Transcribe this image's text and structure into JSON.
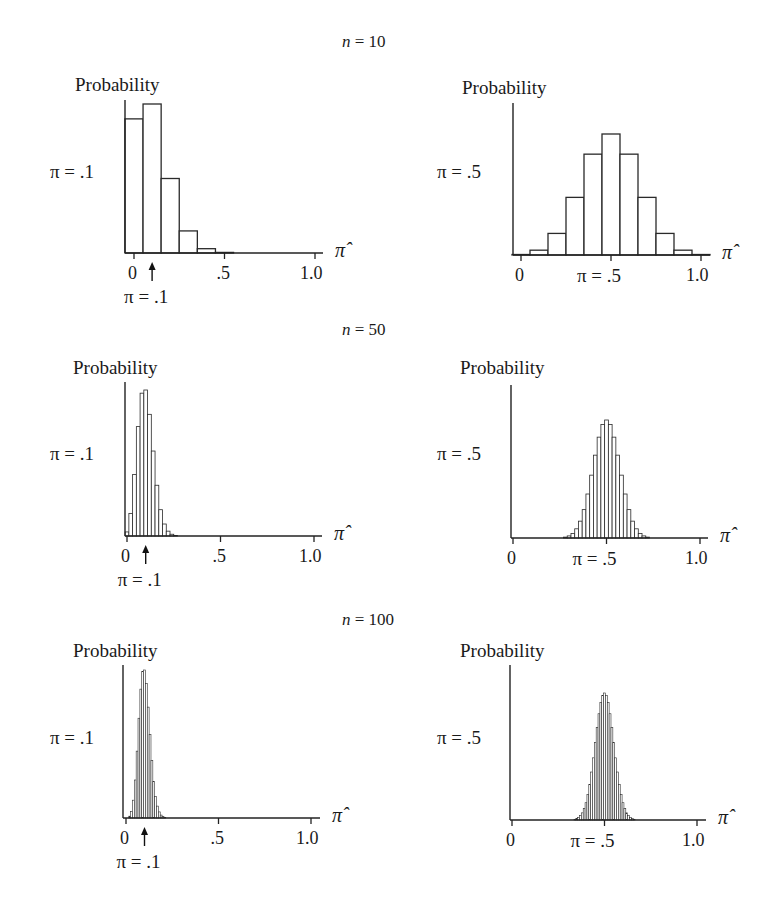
{
  "figure": {
    "rows": [
      {
        "n_label": "n = 10",
        "n_var": "n",
        "n_eq": " = 10"
      },
      {
        "n_label": "n = 50",
        "n_var": "n",
        "n_eq": " = 50"
      },
      {
        "n_label": "n = 100",
        "n_var": "n",
        "n_eq": " = 100"
      }
    ],
    "ylabel": "Probability",
    "xlabel": "π̂",
    "tick_labels": [
      "0",
      ".5",
      "1.0"
    ],
    "left_pi_label": "π = .1",
    "right_pi_label": "π = .5",
    "left_arrow_label": "π = .1",
    "right_center_label": "π = .5"
  },
  "chart_data": [
    {
      "type": "bar",
      "title": "n = 10, π = .1",
      "n": 10,
      "pi": 0.1,
      "xlabel": "π̂",
      "ylabel": "Probability",
      "xlim": [
        0,
        1
      ],
      "categories": [
        0,
        0.1,
        0.2,
        0.3,
        0.4,
        0.5,
        0.6,
        0.7,
        0.8,
        0.9,
        1.0
      ],
      "values": [
        0.3487,
        0.3874,
        0.1937,
        0.0574,
        0.0112,
        0.0015,
        0.0001,
        0,
        0,
        0,
        0
      ]
    },
    {
      "type": "bar",
      "title": "n = 10, π = .5",
      "n": 10,
      "pi": 0.5,
      "xlabel": "π̂",
      "ylabel": "Probability",
      "xlim": [
        0,
        1
      ],
      "categories": [
        0,
        0.1,
        0.2,
        0.3,
        0.4,
        0.5,
        0.6,
        0.7,
        0.8,
        0.9,
        1.0
      ],
      "values": [
        0.001,
        0.0098,
        0.0439,
        0.1172,
        0.2051,
        0.2461,
        0.2051,
        0.1172,
        0.0439,
        0.0098,
        0.001
      ]
    },
    {
      "type": "bar",
      "title": "n = 50, π = .1",
      "n": 50,
      "pi": 0.1,
      "xlabel": "π̂",
      "ylabel": "Probability",
      "xlim": [
        0,
        1
      ],
      "peak": 0.1849
    },
    {
      "type": "bar",
      "title": "n = 50, π = .5",
      "n": 50,
      "pi": 0.5,
      "xlabel": "π̂",
      "ylabel": "Probability",
      "xlim": [
        0,
        1
      ],
      "peak": 0.1123
    },
    {
      "type": "bar",
      "title": "n = 100, π = .1",
      "n": 100,
      "pi": 0.1,
      "xlabel": "π̂",
      "ylabel": "Probability",
      "xlim": [
        0,
        1
      ],
      "peak": 0.1319
    },
    {
      "type": "bar",
      "title": "n = 100, π = .5",
      "n": 100,
      "pi": 0.5,
      "xlabel": "π̂",
      "ylabel": "Probability",
      "xlim": [
        0,
        1
      ],
      "peak": 0.0796
    }
  ]
}
